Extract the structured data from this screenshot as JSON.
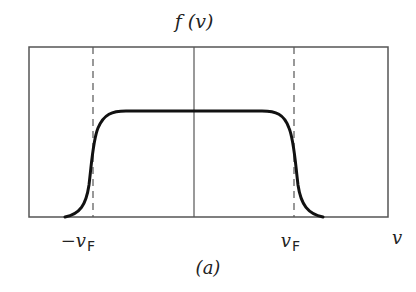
{
  "diagram": {
    "y_label": "f (v)",
    "x_label": "v",
    "tick_left": {
      "prefix": "−v",
      "subscript": "F"
    },
    "tick_right": {
      "prefix": "v",
      "subscript": "F"
    },
    "caption": "(a)",
    "colors": {
      "frame": "#555555",
      "curve": "#111111",
      "dashed": "#555555"
    }
  }
}
